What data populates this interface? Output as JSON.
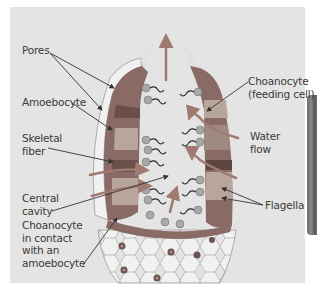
{
  "figure": {
    "background_color": "#e4e4e4",
    "colors": {
      "water_flow_arrow": "#a07a70",
      "body_wall": "#8a6a64",
      "choanocyte_layer": "#9b9b9b",
      "mesohyl": "#b8a59b",
      "outer_cells": "#f2f2f2",
      "leader_line": "#333333"
    }
  },
  "labels": {
    "pores": "Pores",
    "amoebocyte": "Amoebocyte",
    "skeletal_fiber": "Skeletal\nfiber",
    "central_cavity": "Central\ncavity",
    "choanocyte_contact": "Choanocyte\nin contact\nwith an\namoebocyte",
    "choanocyte": "Choanocyte\n(feeding cell)",
    "water_flow": "Water\nflow",
    "flagella": "Flagella"
  }
}
